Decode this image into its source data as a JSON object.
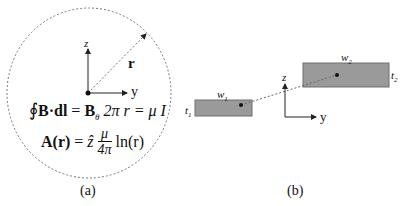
{
  "panel_a": {
    "caption": "(a)",
    "axis_z": "z",
    "axis_y": "y",
    "radius_label": "r",
    "equation_1": {
      "oint": "∮",
      "lhs": "B·dl",
      "eq1": " = ",
      "b_theta": "B",
      "theta_sub": "θ",
      "mid": " 2π r = μ I"
    },
    "equation_2": {
      "lhs": "A(r)",
      "eq": " = ",
      "zhat": "ẑ",
      "frac_num": "μ",
      "frac_den": "4π",
      "rhs": "ln(r)"
    }
  },
  "panel_b": {
    "caption": "(b)",
    "axis_z": "z",
    "axis_y": "y",
    "wire_1": {
      "width_label": "w",
      "width_sub": "1",
      "thick_label": "t",
      "thick_sub": "1"
    },
    "wire_2": {
      "width_label": "w",
      "width_sub": "2",
      "thick_label": "t",
      "thick_sub": "2"
    }
  },
  "colors": {
    "wire_fill": "#9a9a9a",
    "wire_stroke": "#6e6e6e",
    "line": "#222222",
    "dashed": "#777777"
  }
}
